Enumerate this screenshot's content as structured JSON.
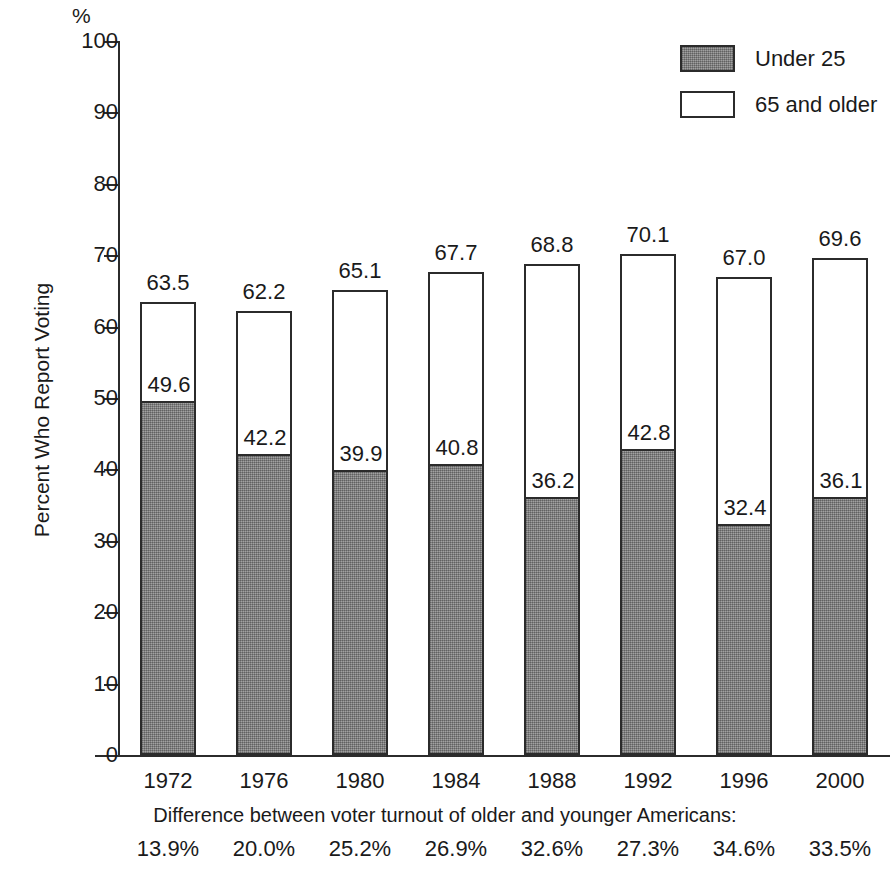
{
  "chart_data": {
    "type": "bar",
    "title": "",
    "subtitle": "",
    "stacked": true,
    "xlabel": "",
    "ylabel": "Percent Who Report Voting",
    "y_unit_label": "%",
    "ylim": [
      0,
      100
    ],
    "y_ticks": [
      0,
      10,
      20,
      30,
      40,
      50,
      60,
      70,
      80,
      90,
      100
    ],
    "grid": false,
    "legend_position": "top-right",
    "categories": [
      "1972",
      "1976",
      "1980",
      "1984",
      "1988",
      "1992",
      "1996",
      "2000"
    ],
    "series": [
      {
        "name": "Under 25",
        "style": "filled-gray",
        "color": "#8a8a8a",
        "values": [
          49.6,
          42.2,
          39.9,
          40.8,
          36.2,
          42.8,
          32.4,
          36.1
        ]
      },
      {
        "name": "65 and older",
        "style": "hollow-white",
        "color": "#ffffff",
        "values": [
          63.5,
          62.2,
          65.1,
          67.7,
          68.8,
          70.1,
          67.0,
          69.6
        ]
      }
    ],
    "annotations": {
      "caption": "Difference between voter turnout of older and younger Americans:",
      "differences": [
        "13.9%",
        "20.0%",
        "25.2%",
        "26.9%",
        "32.6%",
        "27.3%",
        "34.6%",
        "33.5%"
      ]
    }
  },
  "legend": {
    "items": [
      {
        "label": "Under 25",
        "swatch": "filled"
      },
      {
        "label": "65 and older",
        "swatch": "hollow"
      }
    ]
  },
  "colors": {
    "ink": "#2b2b2b",
    "bar_gray": "#8a8a8a",
    "bar_white": "#ffffff",
    "background": "#ffffff"
  }
}
